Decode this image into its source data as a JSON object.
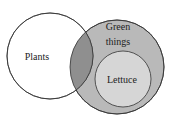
{
  "diagram": {
    "type": "venn",
    "sets": [
      {
        "id": "plants",
        "label": "Plants",
        "fill": "#ffffff"
      },
      {
        "id": "green",
        "label_line1": "Green",
        "label_line2": "things",
        "fill": "#b9b9b9"
      },
      {
        "id": "lettuce",
        "label": "Lettuce",
        "fill": "#d6d6d6"
      }
    ],
    "overlap_fill": "#8f8f8f",
    "stroke": "#333333"
  }
}
